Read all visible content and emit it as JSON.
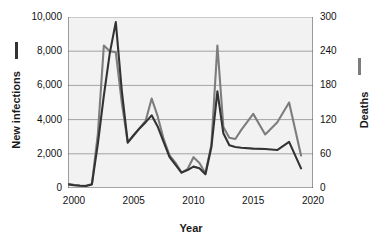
{
  "chart_data": {
    "type": "line",
    "title": "",
    "xlabel": "Year",
    "grid": true,
    "legend_position": "axis-titles",
    "x": [
      1999.5,
      2000,
      2000.5,
      2001,
      2001.5,
      2002,
      2002.5,
      2003,
      2003.5,
      2004,
      2004.5,
      2005,
      2005.5,
      2006,
      2006.5,
      2007,
      2007.5,
      2008,
      2008.5,
      2009,
      2009.5,
      2010,
      2010.5,
      2011,
      2011.5,
      2012,
      2012.5,
      2013,
      2013.5,
      2014,
      2015,
      2016,
      2017,
      2018,
      2019
    ],
    "xlim": [
      1999.5,
      2020
    ],
    "xticks": [
      2000,
      2005,
      2010,
      2015,
      2020
    ],
    "xticklabels": [
      "2000",
      "2005",
      "2010",
      "2015",
      "2020"
    ],
    "axes": [
      {
        "id": "left",
        "label": "New infections",
        "color": "#333333",
        "lim": [
          0,
          10000
        ],
        "ticks": [
          0,
          2000,
          4000,
          6000,
          8000,
          10000
        ],
        "ticklabels": [
          "0",
          "2,000",
          "4,000",
          "6,000",
          "8,000",
          "10,000"
        ]
      },
      {
        "id": "right",
        "label": "Deaths",
        "color": "#7d7d7d",
        "lim": [
          0,
          300
        ],
        "ticks": [
          0,
          60,
          120,
          180,
          240,
          300
        ],
        "ticklabels": [
          "0",
          "60",
          "120",
          "180",
          "240",
          "300"
        ]
      }
    ],
    "series": [
      {
        "name": "New infections",
        "axis": "left",
        "color": "#333333",
        "values": [
          210,
          160,
          130,
          120,
          210,
          2600,
          5400,
          7900,
          9700,
          5700,
          2650,
          3100,
          3500,
          3850,
          4250,
          3600,
          2700,
          1800,
          1350,
          900,
          1050,
          1250,
          1150,
          800,
          2400,
          5650,
          3200,
          2500,
          2400,
          2350,
          2300,
          2280,
          2220,
          2700,
          1150
        ]
      },
      {
        "name": "Deaths",
        "axis": "right",
        "color": "#7d7d7d",
        "values": [
          7,
          5.5,
          4.5,
          4,
          7,
          95,
          250,
          240,
          238,
          150,
          80,
          92,
          105,
          118,
          157,
          126,
          86,
          57,
          44,
          27,
          33,
          54,
          44,
          26,
          76,
          250,
          107,
          88,
          86,
          102,
          130,
          94,
          115,
          150,
          57
        ]
      }
    ]
  },
  "legend": {
    "infections_marker": "dash-dark",
    "deaths_marker": "dash-gray"
  },
  "style": {
    "plot_background": "#f2f2f2",
    "grid_color": "#9a9a9a",
    "axis_color": "#555555",
    "text_color": "#111111"
  }
}
